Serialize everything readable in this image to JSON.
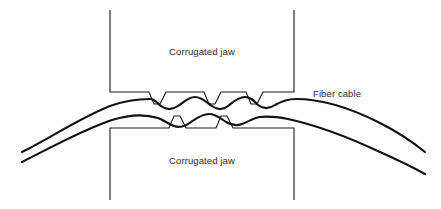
{
  "figure": {
    "width": 441,
    "height": 209,
    "background_color": "#ffffff",
    "line_color": "#1a1a1a",
    "cable_color": "#111111",
    "text_color": "#2b2b2b"
  },
  "labels": {
    "upper_jaw": "Corrugated jaw",
    "lower_jaw": "Corrugated jaw",
    "fiber_cable": "Fiber cable"
  },
  "parts": {
    "upper_jaw": {
      "name": "Corrugated jaw",
      "position": "top",
      "teeth_count": 3,
      "teeth_direction": "down",
      "left_edge_x": 110,
      "right_edge_x": 294,
      "top_y": 10,
      "bottom_y": 92
    },
    "lower_jaw": {
      "name": "Corrugated jaw",
      "position": "bottom",
      "teeth_count": 2,
      "teeth_direction": "up",
      "left_edge_x": 110,
      "right_edge_x": 294,
      "top_y": 128,
      "bottom_y": 200
    },
    "fiber_cable": {
      "name": "Fiber cable",
      "stroke_count": 2,
      "left_tip_x": 22,
      "right_tip_x": 425,
      "shape": "corrugated sinuous band clamped between jaws"
    }
  }
}
